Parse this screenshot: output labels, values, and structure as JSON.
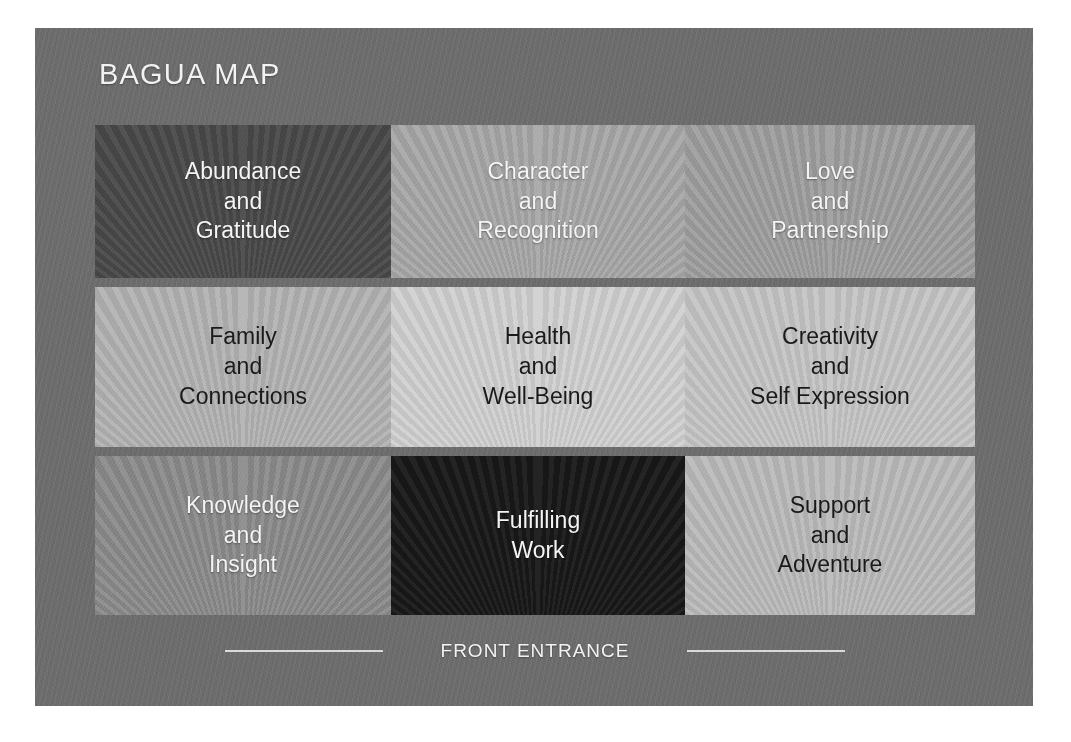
{
  "panel": {
    "background_color": "#6e6e6e"
  },
  "header": {
    "title": "BAGUA MAP"
  },
  "grid": {
    "rows": 3,
    "columns": 3,
    "cells": [
      {
        "id": "abundance-gratitude",
        "lines": [
          "Abundance",
          "and",
          "Gratitude"
        ],
        "text_color": "#f4f4f4",
        "background_color": "#4a4a4a",
        "tone": "dark"
      },
      {
        "id": "character-recognition",
        "lines": [
          "Character",
          "and",
          "Recognition"
        ],
        "text_color": "#f4f4f4",
        "background_color": "#a9a9a9",
        "tone": "medium-light"
      },
      {
        "id": "love-partnership",
        "lines": [
          "Love",
          "and",
          "Partnership"
        ],
        "text_color": "#f4f4f4",
        "background_color": "#a0a0a0",
        "tone": "medium-light"
      },
      {
        "id": "family-connections",
        "lines": [
          "Family",
          "and",
          "Connections"
        ],
        "text_color": "#1a1a1a",
        "background_color": "#b4b4b4",
        "tone": "light"
      },
      {
        "id": "health-wellbeing",
        "lines": [
          "Health",
          "and",
          "Well-Being"
        ],
        "text_color": "#1a1a1a",
        "background_color": "#d2d2d2",
        "tone": "lightest"
      },
      {
        "id": "creativity-self-expression",
        "lines": [
          "Creativity",
          "and",
          "Self Expression"
        ],
        "text_color": "#1a1a1a",
        "background_color": "#c6c6c6",
        "tone": "light"
      },
      {
        "id": "knowledge-insight",
        "lines": [
          "Knowledge",
          "and",
          "Insight"
        ],
        "text_color": "#f4f4f4",
        "background_color": "#8d8d8d",
        "tone": "medium"
      },
      {
        "id": "fulfilling-work",
        "lines": [
          "Fulfilling",
          "Work"
        ],
        "text_color": "#f4f4f4",
        "background_color": "#181818",
        "tone": "darkest"
      },
      {
        "id": "support-adventure",
        "lines": [
          "Support",
          "and",
          "Adventure"
        ],
        "text_color": "#1a1a1a",
        "background_color": "#bcbcbc",
        "tone": "light"
      }
    ]
  },
  "footer": {
    "label": "FRONT ENTRANCE",
    "rule_color": "#e3e3e3"
  }
}
